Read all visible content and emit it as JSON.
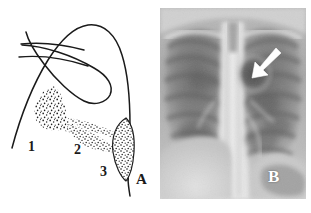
{
  "figure": {
    "type": "two-panel-medical-figure",
    "background_color": "#ffffff",
    "ink_color": "#1a1a1a",
    "width": 311,
    "height": 213
  },
  "panel_a": {
    "id": "A",
    "label": "A",
    "kind": "line-drawing-schematic",
    "description": "Schematic line drawing of a lung field outline with overlying linear structures and three stippled opacity regions",
    "label_position": {
      "x": 136,
      "y": 172
    },
    "region_labels": [
      {
        "id": "1",
        "label": "1",
        "x": 28,
        "y": 140,
        "meaning": "stippled-opacity-region-1"
      },
      {
        "id": "2",
        "label": "2",
        "x": 74,
        "y": 143,
        "meaning": "stippled-opacity-region-2"
      },
      {
        "id": "3",
        "label": "3",
        "x": 100,
        "y": 165,
        "meaning": "stippled-opacity-region-3"
      }
    ],
    "outline_color": "#1a1a1a",
    "stipple_color": "#1a1a1a"
  },
  "panel_b": {
    "id": "B",
    "label": "B",
    "kind": "chest-radiograph",
    "description": "Frontal chest radiograph showing bilateral lung fields, ribs, central spine and mediastinum, with a white arrow marker indicating a lucency in the left upper lung zone",
    "label_position": {
      "x": 268,
      "y": 168
    },
    "label_color": "#ffffff",
    "arrow": {
      "name": "pointer-arrow",
      "color": "#ffffff",
      "tip": {
        "x": 255,
        "y": 66
      },
      "tail": {
        "x": 277,
        "y": 50
      },
      "direction": "down-left"
    },
    "frame": {
      "x": 160,
      "y": 8,
      "width": 146,
      "height": 191
    }
  }
}
